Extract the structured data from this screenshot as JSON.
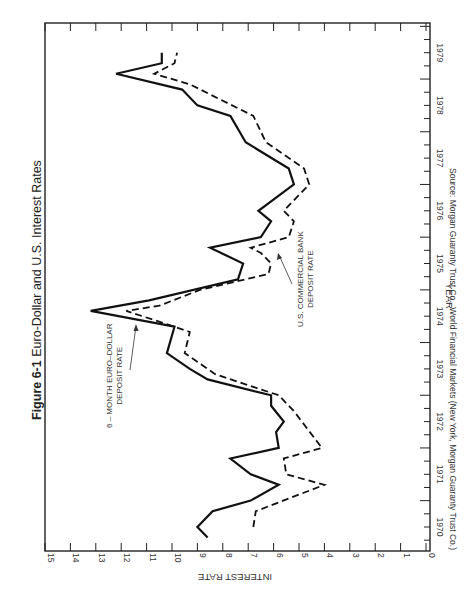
{
  "figure": {
    "label": "Figure 6-1",
    "title": "Euro-Dollar and U.S. Interest Rates",
    "source": "Source: Morgan Guaranty Trust Co., World Financial Markets (New York, Morgan Guaranty Trust Co.)",
    "orientation": "rotated 90° (landscape figure printed on portrait page)"
  },
  "annotations": {
    "euro_line1": "6 – MONTH EURO–DOLLAR",
    "euro_line2": "DEPOSIT RATE",
    "us_line1": "U.S. COMMERCIAL BANK",
    "us_line2": "DEPOSIT RATE"
  },
  "axes": {
    "xlabel": "YEAR",
    "ylabel": "INTEREST RATE"
  },
  "colors": {
    "line": "#111111",
    "frame": "#222222",
    "background": "#ffffff"
  },
  "chart_data": {
    "type": "line",
    "title": "Figure 6-1 Euro-Dollar and U.S. Interest Rates",
    "xlabel": "YEAR",
    "ylabel": "INTEREST RATE",
    "x_ticks": [
      "1970",
      "1971",
      "1972",
      "1973",
      "1974",
      "1975",
      "1976",
      "1977",
      "1978",
      "1979"
    ],
    "y_ticks": [
      0,
      1,
      2,
      3,
      4,
      5,
      6,
      7,
      8,
      9,
      10,
      11,
      12,
      13,
      14,
      15
    ],
    "xlim": [
      1969.5,
      1979.5
    ],
    "ylim": [
      0,
      15
    ],
    "grid": false,
    "legend": "inline annotations with arrows",
    "series": [
      {
        "name": "6-Month Euro-Dollar Deposit Rate",
        "style": "solid",
        "points": [
          [
            1969.8,
            8.6
          ],
          [
            1970.0,
            9.0
          ],
          [
            1970.3,
            8.4
          ],
          [
            1970.5,
            6.9
          ],
          [
            1970.8,
            5.8
          ],
          [
            1971.0,
            6.9
          ],
          [
            1971.3,
            7.7
          ],
          [
            1971.5,
            5.8
          ],
          [
            1971.8,
            5.9
          ],
          [
            1972.0,
            5.6
          ],
          [
            1972.3,
            6.1
          ],
          [
            1972.5,
            6.1
          ],
          [
            1972.8,
            8.6
          ],
          [
            1973.0,
            9.3
          ],
          [
            1973.3,
            10.2
          ],
          [
            1973.8,
            9.9
          ],
          [
            1974.1,
            13.2
          ],
          [
            1974.3,
            10.9
          ],
          [
            1974.7,
            7.4
          ],
          [
            1975.0,
            7.2
          ],
          [
            1975.3,
            8.5
          ],
          [
            1975.5,
            6.5
          ],
          [
            1975.8,
            6.1
          ],
          [
            1976.0,
            6.6
          ],
          [
            1976.5,
            5.2
          ],
          [
            1976.8,
            5.4
          ],
          [
            1977.3,
            7.1
          ],
          [
            1977.8,
            7.7
          ],
          [
            1978.0,
            9.0
          ],
          [
            1978.3,
            9.6
          ],
          [
            1978.6,
            12.2
          ],
          [
            1978.8,
            10.4
          ],
          [
            1979.0,
            10.4
          ]
        ]
      },
      {
        "name": "U.S. Commercial Bank Deposit Rate",
        "style": "dashed",
        "points": [
          [
            1970.0,
            6.8
          ],
          [
            1970.3,
            6.7
          ],
          [
            1970.8,
            4.0
          ],
          [
            1971.0,
            5.5
          ],
          [
            1971.3,
            5.6
          ],
          [
            1971.5,
            4.1
          ],
          [
            1972.2,
            5.2
          ],
          [
            1972.5,
            5.8
          ],
          [
            1972.9,
            8.3
          ],
          [
            1973.3,
            9.5
          ],
          [
            1973.7,
            9.3
          ],
          [
            1973.8,
            9.9
          ],
          [
            1974.1,
            11.8
          ],
          [
            1974.2,
            10.5
          ],
          [
            1974.5,
            8.9
          ],
          [
            1974.8,
            6.2
          ],
          [
            1975.0,
            6.1
          ],
          [
            1975.2,
            6.5
          ],
          [
            1975.3,
            6.9
          ],
          [
            1975.5,
            5.4
          ],
          [
            1975.8,
            5.2
          ],
          [
            1976.0,
            5.6
          ],
          [
            1976.5,
            4.6
          ],
          [
            1976.8,
            4.8
          ],
          [
            1977.3,
            6.3
          ],
          [
            1977.8,
            6.8
          ],
          [
            1978.4,
            9.3
          ],
          [
            1978.6,
            10.7
          ],
          [
            1978.8,
            9.9
          ],
          [
            1979.0,
            9.8
          ]
        ]
      }
    ]
  }
}
